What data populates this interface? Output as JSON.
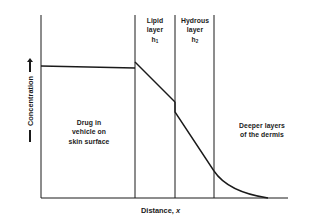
{
  "diagram": {
    "x_axis_label": "Distance,",
    "x_axis_var": "x",
    "y_axis_label": "Concentration",
    "regions": [
      {
        "id": "vehicle",
        "lines": [
          "Drug in",
          "vehicle on",
          "skin surface"
        ]
      },
      {
        "id": "lipid",
        "lines": [
          "Lipid",
          "layer"
        ],
        "symbol": "h",
        "subscript": "1"
      },
      {
        "id": "hydrous",
        "lines": [
          "Hydrous",
          "layer"
        ],
        "symbol": "h",
        "subscript": "2"
      },
      {
        "id": "dermis",
        "lines": [
          "Deeper layers",
          "of the dermis"
        ]
      }
    ],
    "colors": {
      "line": "#1a1a1a",
      "background": "#ffffff"
    }
  }
}
